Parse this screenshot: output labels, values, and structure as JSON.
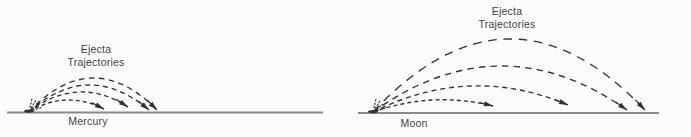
{
  "figure": {
    "background_color": "#fcfcfc",
    "ink_color": "#333333",
    "ground_color": "#8a8a8a",
    "text_color": "#424242",
    "panels": [
      {
        "id": "mercury",
        "body_label": "Mercury",
        "annotation_line1": "Ejecta",
        "annotation_line2": "Trajectories",
        "trajectory_count": 4,
        "ground": {
          "x1": 7,
          "x2": 323,
          "y": 112.5
        },
        "launch": {
          "x": 29,
          "y": 111.5
        },
        "trajectories": [
          {
            "land_x": 104,
            "end_y": 109,
            "apex_y": 100
          },
          {
            "land_x": 128,
            "end_y": 107,
            "apex_y": 92
          },
          {
            "land_x": 149,
            "end_y": 110,
            "apex_y": 85
          },
          {
            "land_x": 157,
            "end_y": 110,
            "apex_y": 78
          }
        ]
      },
      {
        "id": "moon",
        "body_label": "Moon",
        "annotation_line1": "Ejecta",
        "annotation_line2": "Trajectories",
        "trajectory_count": 4,
        "ground": {
          "x1": 358,
          "x2": 659,
          "y": 113
        },
        "launch": {
          "x": 373,
          "y": 112
        },
        "trajectories": [
          {
            "land_x": 493,
            "end_y": 106,
            "apex_y": 100
          },
          {
            "land_x": 568,
            "end_y": 105,
            "apex_y": 86
          },
          {
            "land_x": 627,
            "end_y": 110,
            "apex_y": 66
          },
          {
            "land_x": 645,
            "end_y": 110,
            "apex_y": 39
          }
        ]
      }
    ]
  }
}
